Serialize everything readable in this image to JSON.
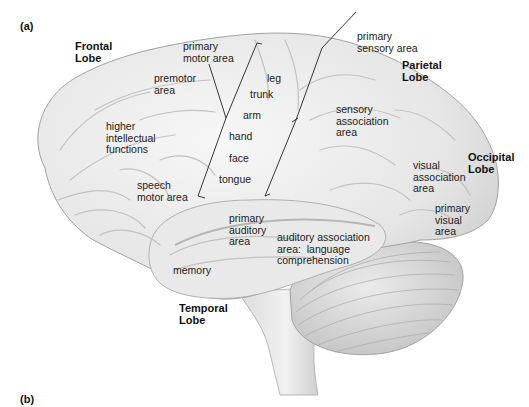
{
  "figure": {
    "panel_a": "(a)",
    "panel_b": "(b)",
    "lobes": {
      "frontal": "Frontal\nLobe",
      "parietal": "Parietal\nLobe",
      "occipital": "Occipital\nLobe",
      "temporal": "Temporal\nLobe"
    },
    "areas": {
      "primary_motor": "primary\nmotor area",
      "primary_sensory": "primary\nsensory area",
      "premotor": "premotor\narea",
      "higher_intellectual": "higher\nintellectual\nfunctions",
      "speech_motor": "speech\nmotor area",
      "sensory_association": "sensory\nassociation\narea",
      "visual_association": "visual\nassociation\narea",
      "primary_visual": "primary\nvisual\narea",
      "primary_auditory": "primary\nauditory\narea",
      "auditory_association": "auditory association\narea:  language\ncomprehension",
      "memory": "memory"
    },
    "motor_strip": {
      "leg": "leg",
      "trunk": "trunk",
      "arm": "arm",
      "hand": "hand",
      "face": "face",
      "tongue": "tongue"
    }
  },
  "colors": {
    "brain_fill": "#ececec",
    "brain_shadow": "#c9c9c9",
    "outline": "#9a9a9a",
    "cerebellum": "#d8d8d8",
    "pointer_line": "#222222"
  }
}
